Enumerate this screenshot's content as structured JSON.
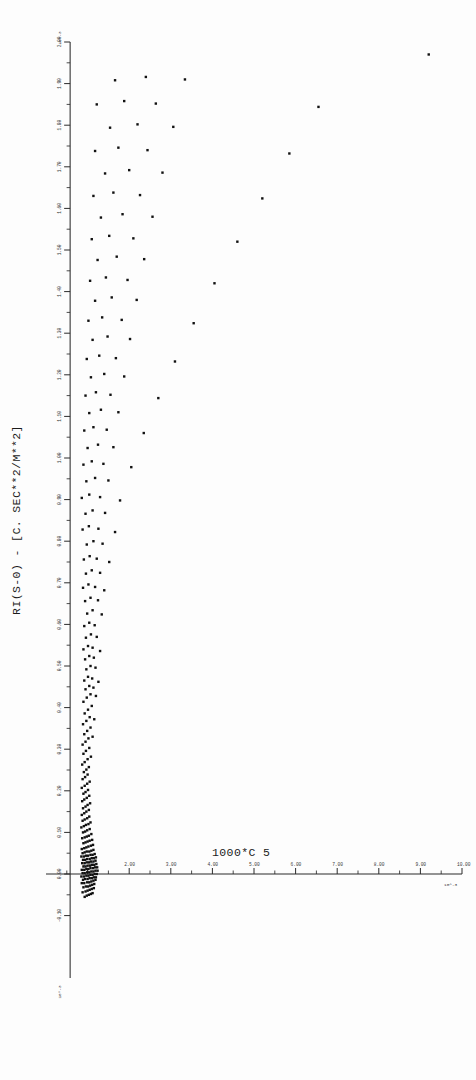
{
  "figure": {
    "kind": "scatter-plot",
    "background_color": "#fdfdfd",
    "ink_color": "#111111"
  },
  "chart_data": {
    "type": "scatter",
    "title": "",
    "subtitle": "",
    "xlabel": "1000*C 5",
    "ylabel": "RI(S-0)  -  [C. SEC**2/M**2]",
    "xlim": [
      0.0,
      10.0
    ],
    "ylim": [
      -0.25,
      2.0
    ],
    "grid": false,
    "legend": null,
    "annotations": [],
    "x_axis": {
      "label": "1000*C 5",
      "label_x_px": 250,
      "exponent_label": "10^-3",
      "major_ticks": [
        1.0,
        2.0,
        3.0,
        4.0,
        5.0,
        6.0,
        7.0,
        8.0,
        9.0,
        10.0
      ],
      "major_tick_labels": [
        "1.00",
        "2.00",
        "3.00",
        "4.00",
        "5.00",
        "6.00",
        "7.00",
        "8.00",
        "9.00",
        "10.00"
      ],
      "minor_ticks_between": 1
    },
    "y_axis": {
      "label": "RI(S-0)  -  [C. SEC**2/M**2]",
      "exponent_label_top": "10^-3",
      "exponent_label_bottom": "10^-3",
      "major_ticks": [
        2.0,
        1.9,
        1.8,
        1.7,
        1.6,
        1.5,
        1.4,
        1.3,
        1.2,
        1.1,
        1.0,
        0.9,
        0.8,
        0.7,
        0.6,
        0.5,
        0.4,
        0.3,
        0.2,
        0.1,
        0.0,
        -0.1
      ],
      "major_tick_labels": [
        "2.00",
        "1.90",
        "1.80",
        "1.70",
        "1.60",
        "1.50",
        "1.40",
        "1.30",
        "1.20",
        "1.10",
        "1.00",
        "0.90",
        "0.80",
        "0.70",
        "0.60",
        "0.50",
        "0.40",
        "0.30",
        "0.20",
        "0.10",
        "0.00",
        "-0.10"
      ],
      "minor_ticks_between": 1
    },
    "marker": {
      "shape": "square",
      "size_px": 2.4,
      "color": "#111111"
    },
    "point_count": 268,
    "points": [
      [
        0.93,
        -0.055
      ],
      [
        0.98,
        -0.052
      ],
      [
        1.03,
        -0.05
      ],
      [
        1.08,
        -0.048
      ],
      [
        1.12,
        -0.046
      ],
      [
        0.88,
        -0.044
      ],
      [
        0.95,
        -0.042
      ],
      [
        1.0,
        -0.04
      ],
      [
        1.05,
        -0.038
      ],
      [
        1.1,
        -0.036
      ],
      [
        1.15,
        -0.034
      ],
      [
        0.9,
        -0.032
      ],
      [
        0.96,
        -0.03
      ],
      [
        1.01,
        -0.03
      ],
      [
        1.06,
        -0.028
      ],
      [
        1.11,
        -0.026
      ],
      [
        1.16,
        -0.024
      ],
      [
        0.86,
        -0.022
      ],
      [
        0.92,
        -0.022
      ],
      [
        0.99,
        -0.02
      ],
      [
        1.04,
        -0.02
      ],
      [
        1.09,
        -0.018
      ],
      [
        1.14,
        -0.016
      ],
      [
        1.19,
        -0.014
      ],
      [
        0.89,
        -0.014
      ],
      [
        0.94,
        -0.012
      ],
      [
        1.0,
        -0.012
      ],
      [
        1.05,
        -0.01
      ],
      [
        1.1,
        -0.01
      ],
      [
        1.15,
        -0.008
      ],
      [
        1.2,
        -0.008
      ],
      [
        0.85,
        -0.006
      ],
      [
        0.91,
        -0.006
      ],
      [
        0.97,
        -0.004
      ],
      [
        1.02,
        -0.004
      ],
      [
        1.07,
        -0.002
      ],
      [
        1.12,
        -0.002
      ],
      [
        1.17,
        0.0
      ],
      [
        1.22,
        0.0
      ],
      [
        0.88,
        0.002
      ],
      [
        0.93,
        0.002
      ],
      [
        0.99,
        0.004
      ],
      [
        1.04,
        0.004
      ],
      [
        1.09,
        0.006
      ],
      [
        1.14,
        0.006
      ],
      [
        1.19,
        0.008
      ],
      [
        1.24,
        0.008
      ],
      [
        0.86,
        0.01
      ],
      [
        0.92,
        0.01
      ],
      [
        0.97,
        0.012
      ],
      [
        1.02,
        0.012
      ],
      [
        1.07,
        0.014
      ],
      [
        1.13,
        0.014
      ],
      [
        1.18,
        0.016
      ],
      [
        1.23,
        0.016
      ],
      [
        0.9,
        0.018
      ],
      [
        0.95,
        0.018
      ],
      [
        1.0,
        0.02
      ],
      [
        1.06,
        0.02
      ],
      [
        1.11,
        0.022
      ],
      [
        1.16,
        0.022
      ],
      [
        1.21,
        0.024
      ],
      [
        0.87,
        0.026
      ],
      [
        0.93,
        0.026
      ],
      [
        0.98,
        0.028
      ],
      [
        1.03,
        0.028
      ],
      [
        1.08,
        0.03
      ],
      [
        1.14,
        0.03
      ],
      [
        1.19,
        0.032
      ],
      [
        0.89,
        0.034
      ],
      [
        0.94,
        0.034
      ],
      [
        0.99,
        0.036
      ],
      [
        1.05,
        0.036
      ],
      [
        1.1,
        0.038
      ],
      [
        1.15,
        0.038
      ],
      [
        1.2,
        0.04
      ],
      [
        0.85,
        0.042
      ],
      [
        0.91,
        0.042
      ],
      [
        0.96,
        0.044
      ],
      [
        1.01,
        0.044
      ],
      [
        1.07,
        0.046
      ],
      [
        1.12,
        0.046
      ],
      [
        1.17,
        0.048
      ],
      [
        0.88,
        0.05
      ],
      [
        0.93,
        0.052
      ],
      [
        0.98,
        0.054
      ],
      [
        1.04,
        0.054
      ],
      [
        1.09,
        0.056
      ],
      [
        1.14,
        0.058
      ],
      [
        0.86,
        0.06
      ],
      [
        0.92,
        0.062
      ],
      [
        0.97,
        0.064
      ],
      [
        1.02,
        0.066
      ],
      [
        1.08,
        0.068
      ],
      [
        1.13,
        0.07
      ],
      [
        0.9,
        0.074
      ],
      [
        0.95,
        0.076
      ],
      [
        1.0,
        0.078
      ],
      [
        1.05,
        0.08
      ],
      [
        1.11,
        0.082
      ],
      [
        0.87,
        0.086
      ],
      [
        0.93,
        0.088
      ],
      [
        0.98,
        0.09
      ],
      [
        1.03,
        0.092
      ],
      [
        1.09,
        0.096
      ],
      [
        0.89,
        0.1
      ],
      [
        0.94,
        0.102
      ],
      [
        0.99,
        0.105
      ],
      [
        1.05,
        0.108
      ],
      [
        0.85,
        0.112
      ],
      [
        0.91,
        0.115
      ],
      [
        0.96,
        0.118
      ],
      [
        1.02,
        0.12
      ],
      [
        1.07,
        0.124
      ],
      [
        0.88,
        0.128
      ],
      [
        0.93,
        0.131
      ],
      [
        0.99,
        0.134
      ],
      [
        1.04,
        0.138
      ],
      [
        0.86,
        0.142
      ],
      [
        0.92,
        0.146
      ],
      [
        0.97,
        0.15
      ],
      [
        1.03,
        0.154
      ],
      [
        0.89,
        0.158
      ],
      [
        0.95,
        0.162
      ],
      [
        1.0,
        0.166
      ],
      [
        1.06,
        0.17
      ],
      [
        0.87,
        0.175
      ],
      [
        0.92,
        0.179
      ],
      [
        0.98,
        0.183
      ],
      [
        1.04,
        0.188
      ],
      [
        0.9,
        0.193
      ],
      [
        0.95,
        0.197
      ],
      [
        1.01,
        0.202
      ],
      [
        0.86,
        0.207
      ],
      [
        0.93,
        0.212
      ],
      [
        0.99,
        0.217
      ],
      [
        1.05,
        0.222
      ],
      [
        0.88,
        0.228
      ],
      [
        0.94,
        0.233
      ],
      [
        1.0,
        0.239
      ],
      [
        0.91,
        0.245
      ],
      [
        0.97,
        0.251
      ],
      [
        1.03,
        0.257
      ],
      [
        0.87,
        0.263
      ],
      [
        0.93,
        0.269
      ],
      [
        1.0,
        0.276
      ],
      [
        1.08,
        0.282
      ],
      [
        0.9,
        0.289
      ],
      [
        0.96,
        0.296
      ],
      [
        1.04,
        0.303
      ],
      [
        0.88,
        0.311
      ],
      [
        0.95,
        0.318
      ],
      [
        1.02,
        0.326
      ],
      [
        1.12,
        0.33
      ],
      [
        0.92,
        0.336
      ],
      [
        0.99,
        0.344
      ],
      [
        1.07,
        0.352
      ],
      [
        0.89,
        0.36
      ],
      [
        0.97,
        0.368
      ],
      [
        1.05,
        0.377
      ],
      [
        1.16,
        0.372
      ],
      [
        0.93,
        0.386
      ],
      [
        1.01,
        0.395
      ],
      [
        1.1,
        0.404
      ],
      [
        0.9,
        0.414
      ],
      [
        0.98,
        0.424
      ],
      [
        1.07,
        0.432
      ],
      [
        1.2,
        0.428
      ],
      [
        0.95,
        0.444
      ],
      [
        1.04,
        0.452
      ],
      [
        1.14,
        0.448
      ],
      [
        0.92,
        0.465
      ],
      [
        1.01,
        0.474
      ],
      [
        1.11,
        0.47
      ],
      [
        1.26,
        0.462
      ],
      [
        0.97,
        0.492
      ],
      [
        1.07,
        0.5
      ],
      [
        1.19,
        0.496
      ],
      [
        0.94,
        0.516
      ],
      [
        1.04,
        0.524
      ],
      [
        1.15,
        0.52
      ],
      [
        0.9,
        0.54
      ],
      [
        1.01,
        0.548
      ],
      [
        1.12,
        0.544
      ],
      [
        1.3,
        0.536
      ],
      [
        0.96,
        0.568
      ],
      [
        1.08,
        0.576
      ],
      [
        1.22,
        0.57
      ],
      [
        0.92,
        0.596
      ],
      [
        1.04,
        0.604
      ],
      [
        1.17,
        0.598
      ],
      [
        0.99,
        0.626
      ],
      [
        1.12,
        0.634
      ],
      [
        1.34,
        0.624
      ],
      [
        0.94,
        0.656
      ],
      [
        1.07,
        0.664
      ],
      [
        1.25,
        0.658
      ],
      [
        0.89,
        0.688
      ],
      [
        1.02,
        0.696
      ],
      [
        1.18,
        0.69
      ],
      [
        1.4,
        0.682
      ],
      [
        0.96,
        0.722
      ],
      [
        1.1,
        0.73
      ],
      [
        1.3,
        0.724
      ],
      [
        0.91,
        0.756
      ],
      [
        1.05,
        0.764
      ],
      [
        1.22,
        0.758
      ],
      [
        1.52,
        0.75
      ],
      [
        0.98,
        0.792
      ],
      [
        1.14,
        0.8
      ],
      [
        1.36,
        0.794
      ],
      [
        0.88,
        0.828
      ],
      [
        1.03,
        0.836
      ],
      [
        1.26,
        0.83
      ],
      [
        1.66,
        0.822
      ],
      [
        0.95,
        0.866
      ],
      [
        1.12,
        0.874
      ],
      [
        1.42,
        0.868
      ],
      [
        0.86,
        0.904
      ],
      [
        1.04,
        0.912
      ],
      [
        1.3,
        0.906
      ],
      [
        1.78,
        0.898
      ],
      [
        0.97,
        0.944
      ],
      [
        1.18,
        0.952
      ],
      [
        1.5,
        0.946
      ],
      [
        0.9,
        0.984
      ],
      [
        1.1,
        0.992
      ],
      [
        1.38,
        0.986
      ],
      [
        2.05,
        0.978
      ],
      [
        1.0,
        1.024
      ],
      [
        1.25,
        1.032
      ],
      [
        1.62,
        1.026
      ],
      [
        0.92,
        1.066
      ],
      [
        1.14,
        1.074
      ],
      [
        1.46,
        1.068
      ],
      [
        2.35,
        1.06
      ],
      [
        1.04,
        1.108
      ],
      [
        1.32,
        1.116
      ],
      [
        1.74,
        1.11
      ],
      [
        0.95,
        1.15
      ],
      [
        1.2,
        1.158
      ],
      [
        1.55,
        1.152
      ],
      [
        2.7,
        1.144
      ],
      [
        1.08,
        1.194
      ],
      [
        1.4,
        1.202
      ],
      [
        1.88,
        1.196
      ],
      [
        0.98,
        1.238
      ],
      [
        1.28,
        1.246
      ],
      [
        1.68,
        1.24
      ],
      [
        3.1,
        1.232
      ],
      [
        1.12,
        1.284
      ],
      [
        1.48,
        1.292
      ],
      [
        2.02,
        1.286
      ],
      [
        1.02,
        1.33
      ],
      [
        1.35,
        1.338
      ],
      [
        1.82,
        1.332
      ],
      [
        3.55,
        1.324
      ],
      [
        1.18,
        1.378
      ],
      [
        1.58,
        1.386
      ],
      [
        2.18,
        1.38
      ],
      [
        1.06,
        1.426
      ],
      [
        1.44,
        1.434
      ],
      [
        1.96,
        1.428
      ],
      [
        4.05,
        1.42
      ],
      [
        1.24,
        1.476
      ],
      [
        1.7,
        1.484
      ],
      [
        2.36,
        1.478
      ],
      [
        1.1,
        1.526
      ],
      [
        1.52,
        1.534
      ],
      [
        2.1,
        1.528
      ],
      [
        4.6,
        1.52
      ],
      [
        1.32,
        1.578
      ],
      [
        1.84,
        1.586
      ],
      [
        2.56,
        1.58
      ],
      [
        1.14,
        1.63
      ],
      [
        1.62,
        1.638
      ],
      [
        2.26,
        1.632
      ],
      [
        5.2,
        1.624
      ],
      [
        1.42,
        1.684
      ],
      [
        2.0,
        1.692
      ],
      [
        2.8,
        1.686
      ],
      [
        1.18,
        1.738
      ],
      [
        1.74,
        1.746
      ],
      [
        2.44,
        1.74
      ],
      [
        5.85,
        1.732
      ],
      [
        1.54,
        1.794
      ],
      [
        2.2,
        1.802
      ],
      [
        3.06,
        1.796
      ],
      [
        1.22,
        1.85
      ],
      [
        1.88,
        1.858
      ],
      [
        2.64,
        1.852
      ],
      [
        6.55,
        1.844
      ],
      [
        1.66,
        1.908
      ],
      [
        2.4,
        1.916
      ],
      [
        3.34,
        1.91
      ],
      [
        9.2,
        1.97
      ]
    ]
  }
}
